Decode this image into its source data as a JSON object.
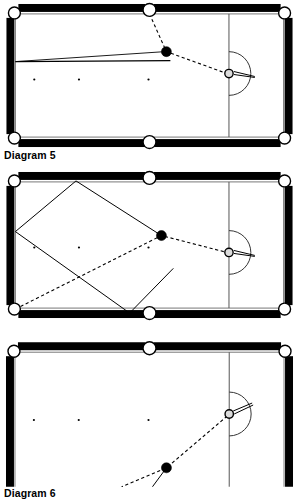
{
  "page": {
    "background_color": "#ffffff",
    "ink_color": "#000000"
  },
  "captions": {
    "diagram_5": "Diagram 5",
    "diagram_6": "Diagram 6",
    "diagram_7": ""
  },
  "table_style": {
    "cloth_color": "#ffffff",
    "rail_color": "#000000",
    "cushion_line_color": "#6b6b6b",
    "pocket_fill": "#ffffff",
    "pocket_stroke": "#000000",
    "line_color": "#000000",
    "baulk_line_color": "#555555",
    "spot_color": "#000000",
    "object_ball_fill": "#000000",
    "cue_ball_fill": "#ffffff"
  },
  "figures": [
    {
      "id": "diagram-5",
      "caption": "Diagram 5",
      "elements": {
        "pockets": [
          {
            "name": "top-left-pocket",
            "x": 10,
            "y": 11
          },
          {
            "name": "top-middle-pocket",
            "x": 146,
            "y": 8
          },
          {
            "name": "top-right-pocket",
            "x": 282,
            "y": 11
          },
          {
            "name": "bottom-left-pocket",
            "x": 10,
            "y": 137
          },
          {
            "name": "bottom-middle-pocket",
            "x": 146,
            "y": 141
          },
          {
            "name": "bottom-right-pocket",
            "x": 282,
            "y": 137
          }
        ],
        "spots": [
          {
            "name": "spot-left",
            "x": 30,
            "y": 78
          },
          {
            "name": "spot-centre",
            "x": 75,
            "y": 78
          },
          {
            "name": "spot-right",
            "x": 145,
            "y": 78
          }
        ],
        "baulk_line": {
          "x": 226,
          "y1": 16,
          "y2": 133
        },
        "d_arc": {
          "cx": 226,
          "cy": 72,
          "r": 22,
          "side": "right"
        },
        "cue_ball": {
          "name": "cue-ball",
          "x": 226,
          "y": 72,
          "r": 4
        },
        "object_ball": {
          "name": "object-ball",
          "x": 163,
          "y": 50,
          "r": 5
        },
        "cue_stick": {
          "x1": 232,
          "y1": 69,
          "x2": 250,
          "y2": 75
        },
        "dashed_path": [
          {
            "x": 146,
            "y": 12
          },
          {
            "x": 163,
            "y": 50
          },
          {
            "x": 224,
            "y": 72
          }
        ],
        "solid_lines": [
          {
            "name": "aim-line-upper",
            "x1": 163,
            "y1": 50,
            "x2": 10,
            "y2": 60
          },
          {
            "name": "aim-line-lower",
            "x1": 165,
            "y1": 58,
            "x2": 10,
            "y2": 60
          }
        ]
      }
    },
    {
      "id": "diagram-6",
      "caption": "Diagram 6",
      "elements": {
        "pockets": [
          {
            "name": "top-left-pocket",
            "x": 10,
            "y": 11
          },
          {
            "name": "top-middle-pocket",
            "x": 146,
            "y": 8
          },
          {
            "name": "top-right-pocket",
            "x": 282,
            "y": 11
          },
          {
            "name": "bottom-left-pocket",
            "x": 10,
            "y": 140
          },
          {
            "name": "bottom-middle-pocket",
            "x": 146,
            "y": 144
          },
          {
            "name": "bottom-right-pocket",
            "x": 282,
            "y": 140
          }
        ],
        "spots": [
          {
            "name": "spot-left",
            "x": 30,
            "y": 78
          },
          {
            "name": "spot-centre",
            "x": 75,
            "y": 78
          },
          {
            "name": "spot-right",
            "x": 145,
            "y": 78
          }
        ],
        "baulk_line": {
          "x": 226,
          "y1": 16,
          "y2": 137
        },
        "d_arc": {
          "cx": 226,
          "cy": 83,
          "r": 22,
          "side": "right"
        },
        "cue_ball": {
          "name": "cue-ball",
          "x": 226,
          "y": 83,
          "r": 4
        },
        "object_ball": {
          "name": "object-ball",
          "x": 158,
          "y": 66,
          "r": 5
        },
        "cue_stick": {
          "x1": 232,
          "y1": 80,
          "x2": 250,
          "y2": 86
        },
        "dashed_path": [
          {
            "x": 10,
            "y": 140
          },
          {
            "x": 158,
            "y": 66
          },
          {
            "x": 224,
            "y": 83
          }
        ],
        "solid_lines": [
          {
            "name": "rhombus-edge-1",
            "x1": 158,
            "y1": 66,
            "x2": 72,
            "y2": 10
          },
          {
            "name": "rhombus-edge-2",
            "x1": 72,
            "y1": 10,
            "x2": 10,
            "y2": 62
          },
          {
            "name": "rhombus-edge-3",
            "x1": 10,
            "y1": 62,
            "x2": 125,
            "y2": 145
          },
          {
            "name": "rhombus-edge-4",
            "x1": 125,
            "y1": 145,
            "x2": 168,
            "y2": 100
          }
        ]
      }
    },
    {
      "id": "diagram-7",
      "caption": "",
      "elements": {
        "pockets": [
          {
            "name": "top-left-pocket",
            "x": 10,
            "y": 11
          },
          {
            "name": "top-middle-pocket",
            "x": 146,
            "y": 8
          },
          {
            "name": "top-right-pocket",
            "x": 282,
            "y": 11
          }
        ],
        "spots": [
          {
            "name": "spot-left",
            "x": 30,
            "y": 80
          },
          {
            "name": "spot-centre",
            "x": 75,
            "y": 80
          },
          {
            "name": "spot-right",
            "x": 145,
            "y": 80
          }
        ],
        "baulk_line": {
          "x": 226,
          "y": 16
        },
        "d_arc": {
          "cx": 226,
          "cy": 74,
          "r": 22,
          "side": "right"
        },
        "cue_ball": {
          "name": "cue-ball",
          "x": 226,
          "y": 74,
          "r": 4
        },
        "object_ball": {
          "name": "object-ball",
          "x": 163,
          "y": 128,
          "r": 5
        },
        "cue_stick": {
          "x1": 231,
          "y1": 71,
          "x2": 248,
          "y2": 64
        },
        "dashed_path": [
          {
            "x": 224,
            "y": 76
          },
          {
            "x": 163,
            "y": 128
          },
          {
            "x": 120,
            "y": 147
          }
        ],
        "solid_lines": [
          {
            "name": "aim-line",
            "x1": 163,
            "y1": 128,
            "x2": 148,
            "y2": 147
          }
        ]
      }
    }
  ]
}
